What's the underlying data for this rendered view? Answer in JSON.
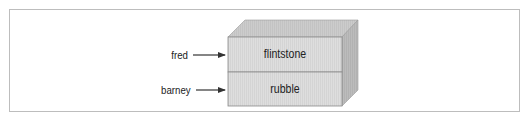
{
  "diagram": {
    "variables": [
      {
        "name": "fred",
        "points_to": "flintstone"
      },
      {
        "name": "barney",
        "points_to": "rubble"
      }
    ],
    "cells": [
      {
        "value": "flintstone"
      },
      {
        "value": "rubble"
      }
    ],
    "colors": {
      "frame_border": "#bdbdbd",
      "front_face": "#dcdcdc",
      "top_face": "#c9c9c9",
      "side_face": "#b8b8b8",
      "edge": "#8a8a8a",
      "arrow": "#333333",
      "text": "#222222"
    }
  }
}
